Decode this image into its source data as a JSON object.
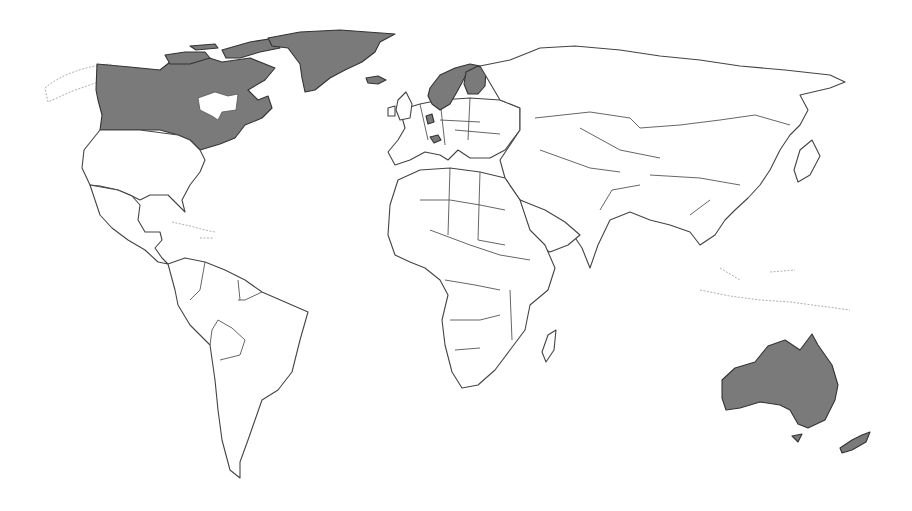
{
  "map": {
    "type": "world-choropleth",
    "projection": "world outline, no labels",
    "colors": {
      "highlight": "#7a7a7a",
      "land": "#ffffff",
      "border": "#444444",
      "background": "#ffffff"
    },
    "highlighted_regions": [
      "Canada",
      "Greenland",
      "Norway",
      "Sweden",
      "Finland",
      "Netherlands",
      "Switzerland",
      "Australia",
      "Tasmania",
      "New Zealand"
    ],
    "unhighlighted_regions": [
      "United States",
      "Mexico",
      "Central America",
      "South America",
      "Africa",
      "Europe (rest)",
      "Russia",
      "Middle East",
      "Asia",
      "Southeast Asia"
    ],
    "legend": null,
    "title": null
  }
}
